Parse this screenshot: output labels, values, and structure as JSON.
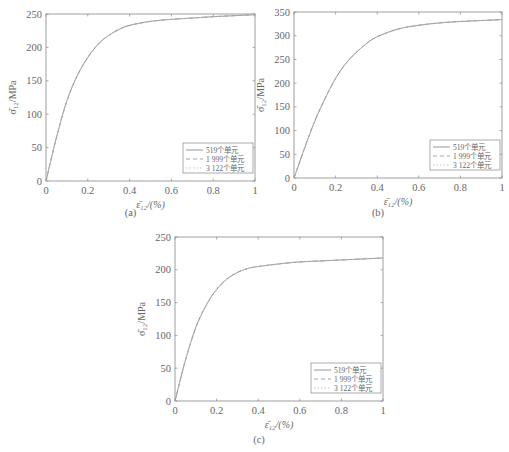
{
  "chart_data": [
    {
      "type": "line",
      "panel_label": "(a)",
      "title": "",
      "xlabel": "ε̄₁₂/(%)",
      "ylabel": "σ̄₁₂/MPa",
      "xlim": [
        0,
        1
      ],
      "ylim": [
        0,
        250
      ],
      "xticks": [
        "0",
        "0.2",
        "0.4",
        "0.6",
        "0.8",
        "1"
      ],
      "yticks": [
        "0",
        "50",
        "100",
        "150",
        "200",
        "250"
      ],
      "grid": false,
      "legend_position": "lower right",
      "x": [
        0,
        0.05,
        0.1,
        0.15,
        0.2,
        0.25,
        0.3,
        0.35,
        0.4,
        0.5,
        0.6,
        0.7,
        0.8,
        0.9,
        1.0
      ],
      "series": [
        {
          "name": "519个单元",
          "style": "solid",
          "values": [
            0,
            65,
            120,
            158,
            185,
            205,
            218,
            227,
            233,
            239,
            242,
            244,
            246,
            247.5,
            249
          ]
        },
        {
          "name": "1 999个单元",
          "style": "dashed",
          "values": [
            0,
            65,
            120,
            158,
            185,
            205,
            218,
            227,
            233,
            239,
            242,
            244,
            246,
            247.5,
            249
          ]
        },
        {
          "name": "3 122个单元",
          "style": "dotted",
          "values": [
            0,
            65,
            120,
            158,
            185,
            205,
            218,
            227,
            233,
            239,
            242,
            244,
            246,
            247.5,
            249
          ]
        }
      ]
    },
    {
      "type": "line",
      "panel_label": "(b)",
      "title": "",
      "xlabel": "ε̄₁₂/(%)",
      "ylabel": "σ̄₁₂/MPa",
      "xlim": [
        0,
        1
      ],
      "ylim": [
        0,
        350
      ],
      "xticks": [
        "0",
        "0.2",
        "0.4",
        "0.6",
        "0.8",
        "1"
      ],
      "yticks": [
        "0",
        "50",
        "100",
        "150",
        "200",
        "250",
        "300",
        "350"
      ],
      "grid": false,
      "legend_position": "lower right",
      "x": [
        0,
        0.05,
        0.1,
        0.15,
        0.2,
        0.25,
        0.3,
        0.35,
        0.4,
        0.5,
        0.6,
        0.7,
        0.8,
        0.9,
        1.0
      ],
      "series": [
        {
          "name": "519个单元",
          "style": "solid",
          "values": [
            0,
            62,
            120,
            168,
            210,
            242,
            265,
            284,
            298,
            314,
            322,
            327,
            330,
            332,
            334
          ]
        },
        {
          "name": "1 999个单元",
          "style": "dashed",
          "values": [
            0,
            62,
            120,
            168,
            210,
            242,
            265,
            284,
            298,
            314,
            322,
            327,
            330,
            332,
            334
          ]
        },
        {
          "name": "3 122个单元",
          "style": "dotted",
          "values": [
            0,
            62,
            120,
            168,
            210,
            242,
            265,
            284,
            298,
            314,
            322,
            327,
            330,
            332,
            334
          ]
        }
      ]
    },
    {
      "type": "line",
      "panel_label": "(c)",
      "title": "",
      "xlabel": "ε̄₁₂/(%)",
      "ylabel": "σ̄₁₂/MPa",
      "xlim": [
        0,
        1
      ],
      "ylim": [
        0,
        250
      ],
      "xticks": [
        "0",
        "0.2",
        "0.4",
        "0.6",
        "0.8",
        "1"
      ],
      "yticks": [
        "0",
        "50",
        "100",
        "150",
        "200",
        "250"
      ],
      "grid": false,
      "legend_position": "lower right",
      "x": [
        0,
        0.05,
        0.1,
        0.15,
        0.2,
        0.25,
        0.3,
        0.35,
        0.4,
        0.5,
        0.6,
        0.7,
        0.8,
        0.9,
        1.0
      ],
      "series": [
        {
          "name": "519个单元",
          "style": "solid",
          "values": [
            0,
            62,
            112,
            146,
            170,
            186,
            196,
            202,
            205,
            209,
            212,
            213.5,
            215,
            216.5,
            218
          ]
        },
        {
          "name": "1 999个单元",
          "style": "dashed",
          "values": [
            0,
            62,
            112,
            146,
            170,
            186,
            196,
            202,
            205,
            209,
            212,
            213.5,
            215,
            216.5,
            218
          ]
        },
        {
          "name": "3 122个单元",
          "style": "dotted",
          "values": [
            0,
            62,
            112,
            146,
            170,
            186,
            196,
            202,
            205,
            209,
            212,
            213.5,
            215,
            216.5,
            218
          ]
        }
      ]
    }
  ],
  "colors": {
    "axis": "#888888",
    "line": "#999999",
    "text": "#666666"
  }
}
